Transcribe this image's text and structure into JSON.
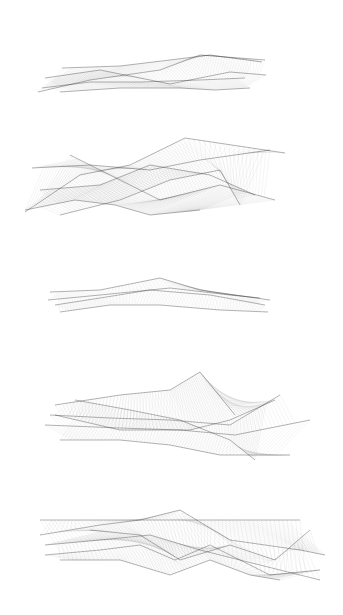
{
  "artwork": {
    "background": "#ffffff",
    "ink": "#2a2a2a",
    "figures": [
      {
        "id": "ribbon-1",
        "top": 50,
        "height": 50,
        "x0": 38,
        "x1": 268,
        "curves": [
          [
            [
              38,
              92
            ],
            [
              90,
              80
            ],
            [
              160,
              70
            ],
            [
              200,
              55
            ],
            [
              265,
              60
            ]
          ],
          [
            [
              45,
              78
            ],
            [
              100,
              70
            ],
            [
              170,
              84
            ],
            [
              230,
              72
            ],
            [
              266,
              75
            ]
          ],
          [
            [
              60,
              92
            ],
            [
              120,
              88
            ],
            [
              180,
              88
            ],
            [
              215,
              90
            ],
            [
              250,
              88
            ]
          ],
          [
            [
              42,
              88
            ],
            [
              90,
              82
            ],
            [
              140,
              82
            ],
            [
              200,
              80
            ],
            [
              245,
              78
            ]
          ],
          [
            [
              62,
              68
            ],
            [
              120,
              66
            ],
            [
              170,
              60
            ],
            [
              210,
              55
            ],
            [
              262,
              62
            ]
          ]
        ],
        "density": 0.45
      },
      {
        "id": "ribbon-2",
        "top": 130,
        "height": 95,
        "x0": 22,
        "x1": 285,
        "curves": [
          [
            [
              25,
              212
            ],
            [
              80,
              175
            ],
            [
              130,
              165
            ],
            [
              185,
              138
            ],
            [
              285,
              153
            ]
          ],
          [
            [
              32,
              168
            ],
            [
              90,
              165
            ],
            [
              150,
              170
            ],
            [
              200,
              160
            ],
            [
              270,
              150
            ]
          ],
          [
            [
              70,
              155
            ],
            [
              110,
              175
            ],
            [
              160,
              200
            ],
            [
              220,
              185
            ],
            [
              275,
              200
            ]
          ],
          [
            [
              25,
              210
            ],
            [
              75,
              200
            ],
            [
              115,
              205
            ],
            [
              150,
              215
            ],
            [
              200,
              210
            ]
          ],
          [
            [
              40,
              190
            ],
            [
              100,
              185
            ],
            [
              150,
              165
            ],
            [
              210,
              175
            ],
            [
              255,
              195
            ]
          ],
          [
            [
              60,
              215
            ],
            [
              120,
              200
            ],
            [
              170,
              180
            ],
            [
              220,
              170
            ],
            [
              240,
              205
            ]
          ]
        ],
        "density": 0.5
      },
      {
        "id": "ribbon-3",
        "top": 275,
        "height": 45,
        "x0": 45,
        "x1": 272,
        "curves": [
          [
            [
              50,
              292
            ],
            [
              100,
              290
            ],
            [
              160,
              278
            ],
            [
              200,
              290
            ],
            [
              270,
              300
            ]
          ],
          [
            [
              55,
              305
            ],
            [
              100,
              298
            ],
            [
              150,
              290
            ],
            [
              210,
              295
            ],
            [
              265,
              305
            ]
          ],
          [
            [
              60,
              312
            ],
            [
              110,
              305
            ],
            [
              160,
              305
            ],
            [
              220,
              310
            ],
            [
              268,
              312
            ]
          ],
          [
            [
              48,
              300
            ],
            [
              100,
              295
            ],
            [
              170,
              288
            ],
            [
              230,
              295
            ],
            [
              260,
              298
            ]
          ]
        ],
        "density": 0.35
      },
      {
        "id": "ribbon-4",
        "top": 368,
        "height": 95,
        "x0": 40,
        "x1": 312,
        "curves": [
          [
            [
              55,
              405
            ],
            [
              120,
              395
            ],
            [
              170,
              390
            ],
            [
              200,
              372
            ],
            [
              235,
              415
            ]
          ],
          [
            [
              50,
              415
            ],
            [
              110,
              418
            ],
            [
              170,
              420
            ],
            [
              230,
              425
            ],
            [
              280,
              395
            ]
          ],
          [
            [
              45,
              425
            ],
            [
              120,
              428
            ],
            [
              180,
              430
            ],
            [
              235,
              435
            ],
            [
              310,
              420
            ]
          ],
          [
            [
              60,
              440
            ],
            [
              120,
              440
            ],
            [
              170,
              445
            ],
            [
              220,
              455
            ],
            [
              290,
              455
            ]
          ],
          [
            [
              75,
              400
            ],
            [
              130,
              410
            ],
            [
              180,
              420
            ],
            [
              230,
              440
            ],
            [
              255,
              460
            ]
          ],
          [
            [
              55,
              415
            ],
            [
              120,
              430
            ],
            [
              190,
              430
            ],
            [
              230,
              420
            ],
            [
              275,
              400
            ]
          ]
        ],
        "density": 0.5
      },
      {
        "id": "ribbon-5",
        "top": 505,
        "height": 85,
        "x0": 35,
        "x1": 328,
        "curves": [
          [
            [
              40,
              535
            ],
            [
              100,
              525
            ],
            [
              140,
              520
            ],
            [
              180,
              510
            ],
            [
              230,
              540
            ],
            [
              300,
              550
            ],
            [
              325,
              555
            ]
          ],
          [
            [
              40,
              520
            ],
            [
              90,
              520
            ],
            [
              140,
              520
            ],
            [
              190,
              520
            ],
            [
              240,
              520
            ],
            [
              300,
              520
            ]
          ],
          [
            [
              45,
              555
            ],
            [
              100,
              550
            ],
            [
              140,
              545
            ],
            [
              175,
              560
            ],
            [
              210,
              545
            ],
            [
              270,
              575
            ],
            [
              320,
              570
            ]
          ],
          [
            [
              60,
              560
            ],
            [
              120,
              560
            ],
            [
              170,
              575
            ],
            [
              210,
              560
            ],
            [
              250,
              575
            ],
            [
              280,
              580
            ]
          ],
          [
            [
              45,
              545
            ],
            [
              100,
              540
            ],
            [
              150,
              535
            ],
            [
              200,
              550
            ],
            [
              240,
              560
            ],
            [
              320,
              580
            ]
          ],
          [
            [
              90,
              530
            ],
            [
              140,
              535
            ],
            [
              180,
              560
            ],
            [
              230,
              545
            ],
            [
              275,
              560
            ],
            [
              310,
              530
            ]
          ]
        ],
        "density": 0.55
      }
    ]
  }
}
